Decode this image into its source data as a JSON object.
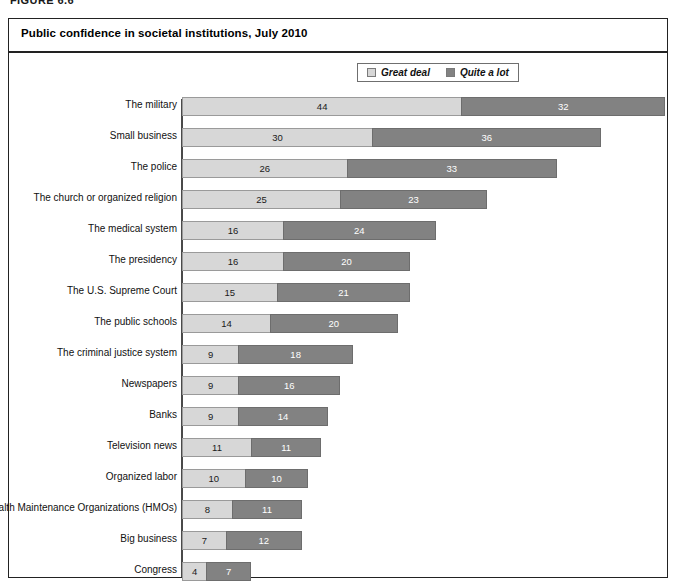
{
  "figure": {
    "caption": "FIGURE 6.6"
  },
  "panel": {
    "title": "Public confidence in societal institutions, July 2010"
  },
  "legend": {
    "items": [
      {
        "label": "Great deal",
        "color": "#d7d7d7",
        "key": "great_deal"
      },
      {
        "label": "Quite a lot",
        "color": "#828282",
        "key": "quite_a_lot"
      }
    ]
  },
  "chart_data": {
    "type": "bar",
    "orientation": "horizontal",
    "stacked": true,
    "title": "Public confidence in societal institutions, July 2010",
    "xlabel": "",
    "ylabel": "",
    "xlim": [
      0,
      76
    ],
    "grid": false,
    "legend_position": "top-center",
    "value_unit": "percent",
    "categories": [
      "The military",
      "Small business",
      "The police",
      "The church or organized religion",
      "The medical system",
      "The presidency",
      "The U.S. Supreme Court",
      "The public schools",
      "The criminal justice system",
      "Newspapers",
      "Banks",
      "Television news",
      "Organized labor",
      "Health Maintenance Organizations (HMOs)",
      "Big business",
      "Congress"
    ],
    "series": [
      {
        "name": "Great deal",
        "color": "#d7d7d7",
        "values": [
          44,
          30,
          26,
          25,
          16,
          16,
          15,
          14,
          9,
          9,
          9,
          11,
          10,
          8,
          7,
          4
        ]
      },
      {
        "name": "Quite a lot",
        "color": "#828282",
        "values": [
          32,
          36,
          33,
          23,
          24,
          20,
          21,
          20,
          18,
          16,
          14,
          11,
          10,
          11,
          12,
          7
        ]
      }
    ],
    "totals": [
      76,
      66,
      59,
      48,
      40,
      36,
      36,
      34,
      27,
      25,
      23,
      22,
      20,
      19,
      19,
      11
    ]
  }
}
